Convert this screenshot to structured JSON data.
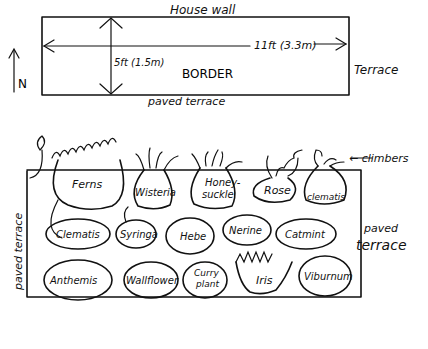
{
  "plan_top": {
    "title_top": "House wall",
    "width_label": "11ft (3.3m)",
    "depth_label": "5ft (1.5m)",
    "center_label": "BORDER",
    "right_label": "Terrace",
    "bottom_label": "paved terrace",
    "north_label": "N"
  },
  "plan_bottom": {
    "climbers_label": "← climbers",
    "left_label": "paved terrace",
    "right_label_line1": "paved",
    "right_label_line2": "terrace",
    "row1": [
      "Ferns",
      "Wisteria",
      "Honey-",
      "suckle",
      "Rose",
      "clematis"
    ],
    "row2": [
      "Clematis",
      "Syringa",
      "Hebe",
      "Nerine",
      "Catmint"
    ],
    "row3": [
      "Anthemis",
      "Wallflower",
      "Curry",
      "plant",
      "Iris",
      "Viburnum"
    ]
  }
}
